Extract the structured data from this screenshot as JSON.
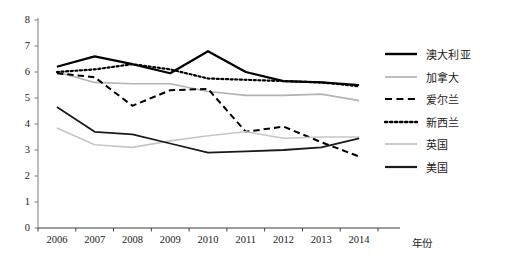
{
  "chart_data": {
    "type": "line",
    "title": "",
    "xlabel": "年份",
    "ylabel": "",
    "categories": [
      "2006",
      "2007",
      "2008",
      "2009",
      "2010",
      "2011",
      "2012",
      "2013",
      "2014"
    ],
    "x": [
      2006,
      2007,
      2008,
      2009,
      2010,
      2011,
      2012,
      2013,
      2014
    ],
    "ylim": [
      0,
      8
    ],
    "yticks": [
      0,
      1,
      2,
      3,
      4,
      5,
      6,
      7,
      8
    ],
    "grid": false,
    "legend_position": "right",
    "series": [
      {
        "name": "澳大利亚",
        "style": "solid",
        "color": "#000000",
        "width": 2.2,
        "values": [
          6.2,
          6.6,
          6.3,
          5.95,
          6.8,
          6.0,
          5.65,
          5.6,
          5.5
        ]
      },
      {
        "name": "加拿大",
        "style": "solid",
        "color": "#b3b3b3",
        "width": 1.6,
        "values": [
          6.0,
          5.6,
          5.55,
          5.55,
          5.25,
          5.1,
          5.1,
          5.15,
          4.9
        ]
      },
      {
        "name": "爱尔兰",
        "style": "dashed",
        "color": "#000000",
        "width": 2.0,
        "values": [
          5.95,
          5.8,
          4.7,
          5.3,
          5.35,
          3.7,
          3.9,
          3.3,
          2.75
        ]
      },
      {
        "name": "新西兰",
        "style": "dotted",
        "color": "#000000",
        "width": 2.2,
        "values": [
          6.0,
          6.1,
          6.3,
          6.1,
          5.75,
          5.7,
          5.65,
          5.6,
          5.45
        ]
      },
      {
        "name": "英国",
        "style": "solid",
        "color": "#c6c6c6",
        "width": 1.6,
        "values": [
          3.85,
          3.2,
          3.1,
          3.35,
          3.55,
          3.7,
          3.45,
          3.5,
          3.5
        ]
      },
      {
        "name": "美国",
        "style": "solid",
        "color": "#1a1a1a",
        "width": 1.8,
        "values": [
          4.65,
          3.7,
          3.6,
          3.25,
          2.9,
          2.95,
          3.0,
          3.1,
          3.45
        ]
      }
    ]
  },
  "axes": {
    "y_tick_labels": [
      "8",
      "7",
      "6",
      "5",
      "4",
      "3",
      "2",
      "1",
      "0"
    ],
    "x_tick_labels": [
      "2006",
      "2007",
      "2008",
      "2009",
      "2010",
      "2011",
      "2012",
      "2013",
      "2014"
    ],
    "x_axis_title": "年份"
  },
  "legend": {
    "items": [
      {
        "label": "澳大利亚",
        "style": "solid",
        "color": "#000000",
        "width": 2.4
      },
      {
        "label": "加拿大",
        "style": "solid",
        "color": "#b9b9b9",
        "width": 1.8
      },
      {
        "label": "爱尔兰",
        "style": "dashed",
        "color": "#000000",
        "width": 2.2
      },
      {
        "label": "新西兰",
        "style": "dotted",
        "color": "#000000",
        "width": 2.4
      },
      {
        "label": "英国",
        "style": "solid",
        "color": "#c6c6c6",
        "width": 1.8
      },
      {
        "label": "美国",
        "style": "solid",
        "color": "#1a1a1a",
        "width": 2.2
      }
    ]
  },
  "footnote": {
    "text": ""
  }
}
